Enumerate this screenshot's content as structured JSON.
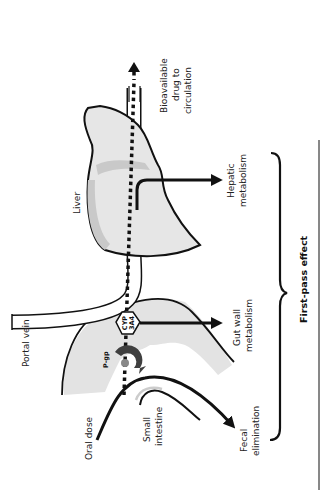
{
  "diagram": {
    "title": "First-pass effect",
    "labels": {
      "oral_dose": "Oral dose",
      "small_intestine_1": "Small",
      "small_intestine_2": "intestine",
      "portal_vein": "Portal vein",
      "liver": "Liver",
      "pgp": "P-gp",
      "cyp_1": "CYP",
      "cyp_2": "3A4",
      "gut_wall_1": "Gut wall",
      "gut_wall_2": "metabolism",
      "hepatic_1": "Hepatic",
      "hepatic_2": "metabolism",
      "fecal_1": "Fecal",
      "fecal_2": "elimination",
      "bioavailable_1": "Bioavailable",
      "bioavailable_2": "drug to",
      "bioavailable_3": "circulation",
      "first_pass": "First-pass effect"
    },
    "colors": {
      "organ_fill": "#e6e6e6",
      "organ_shade": "#c9c9c9",
      "pgp": "#4a4a4a",
      "outline": "#111111"
    }
  }
}
